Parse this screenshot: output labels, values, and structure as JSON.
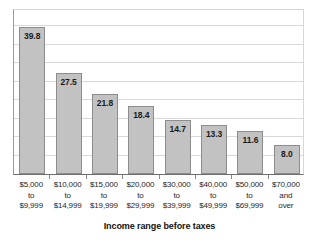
{
  "chart_data": {
    "type": "bar",
    "title": "",
    "subtitle": "",
    "xlabel": "Income range before taxes",
    "ylabel": "",
    "ylim": [
      0,
      45
    ],
    "grid": true,
    "gridline_step": 5,
    "legend": "none",
    "categories": [
      "$5,000 to $9,999",
      "$10,000 to $14,999",
      "$15,000 to $19,999",
      "$20,000 to $29,999",
      "$30,000 to $39,999",
      "$40,000 to $49,999",
      "$50,000 to $69,999",
      "$70,000 and over"
    ],
    "category_lines": [
      [
        "$5,000",
        "to",
        "$9,999"
      ],
      [
        "$10,000",
        "to",
        "$14,999"
      ],
      [
        "$15,000",
        "to",
        "$19,999"
      ],
      [
        "$20,000",
        "to",
        "$29,999"
      ],
      [
        "$30,000",
        "to",
        "$39,999"
      ],
      [
        "$40,000",
        "to",
        "$49,999"
      ],
      [
        "$50,000",
        "to",
        "$69,999"
      ],
      [
        "$70,000",
        "and",
        "over"
      ]
    ],
    "values": [
      39.8,
      27.5,
      21.8,
      18.4,
      14.7,
      13.3,
      11.6,
      8.0
    ],
    "value_labels": [
      "39.8",
      "27.5",
      "21.8",
      "18.4",
      "14.7",
      "13.3",
      "11.6",
      "8.0"
    ],
    "colors": {
      "bar_fill": "#c2c2c2",
      "bar_border": "#8d8d8d",
      "gridline": "#d9d9d9",
      "axis": "#6e6e6e",
      "text": "#1a1a1a",
      "background": "#ffffff"
    }
  }
}
